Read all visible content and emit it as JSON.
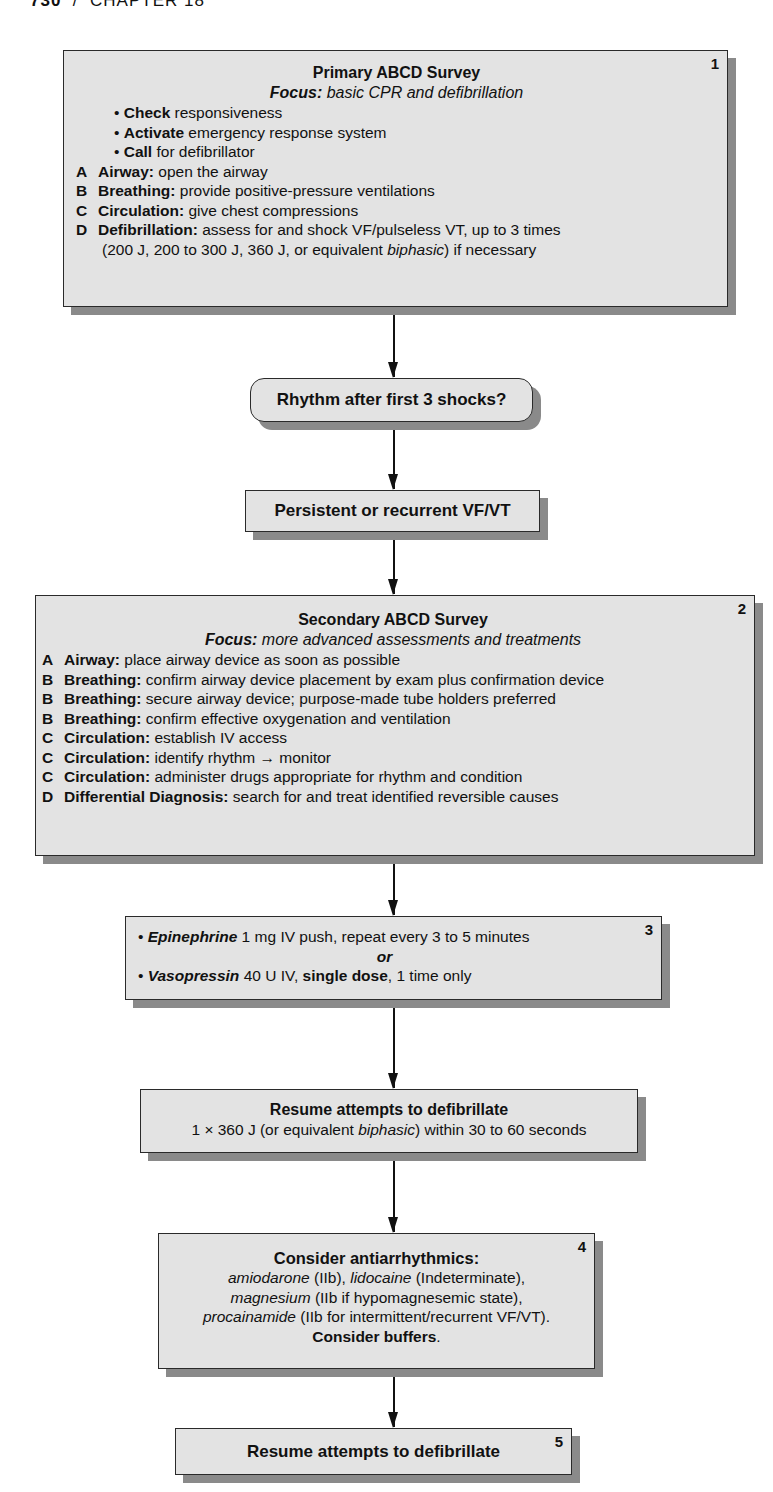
{
  "page_header": {
    "page_number": "730",
    "separator": "/",
    "chapter": "CHAPTER 18"
  },
  "box1": {
    "badge": "1",
    "title": "Primary ABCD Survey",
    "focus_label": "Focus:",
    "focus_text": " basic CPR and defibrillation",
    "bullets": [
      {
        "bold": "Check",
        "text": " responsiveness"
      },
      {
        "bold": "Activate",
        "text": " emergency response system"
      },
      {
        "bold": "Call",
        "text": " for defibrillator"
      }
    ],
    "steps": [
      {
        "letter": "A",
        "bold": "Airway:",
        "text": " open the airway"
      },
      {
        "letter": "B",
        "bold": "Breathing:",
        "text": " provide positive-pressure ventilations"
      },
      {
        "letter": "C",
        "bold": "Circulation:",
        "text": " give chest compressions"
      },
      {
        "letter": "D",
        "bold": "Defibrillation:",
        "text": " assess for and shock VF/pulseless VT, up to 3 times"
      }
    ],
    "continuation_pre": "(200 J, 200 to 300 J, 360 J, or equivalent ",
    "continuation_italic": "biphasic",
    "continuation_post": ") if necessary"
  },
  "decision": {
    "label": "Rhythm after first 3 shocks?"
  },
  "persistent": {
    "label": "Persistent or recurrent VF/VT"
  },
  "box2": {
    "badge": "2",
    "title": "Secondary ABCD Survey",
    "focus_label": "Focus:",
    "focus_text": " more advanced assessments and treatments",
    "steps": [
      {
        "letter": "A",
        "bold": "Airway:",
        "text": " place airway device as soon as possible"
      },
      {
        "letter": "B",
        "bold": "Breathing:",
        "text": " confirm airway device placement by exam plus confirmation device"
      },
      {
        "letter": "B",
        "bold": "Breathing:",
        "text": " secure airway device; purpose-made tube holders preferred"
      },
      {
        "letter": "B",
        "bold": "Breathing:",
        "text": " confirm effective oxygenation and ventilation"
      },
      {
        "letter": "C",
        "bold": "Circulation:",
        "text": " establish IV access"
      },
      {
        "letter": "C",
        "bold": "Circulation:",
        "text": " identify rhythm → monitor"
      },
      {
        "letter": "C",
        "bold": "Circulation:",
        "text": " administer drugs appropriate for rhythm and condition"
      },
      {
        "letter": "D",
        "bold": "Differential Diagnosis:",
        "text": " search for and treat identified reversible causes"
      }
    ]
  },
  "box3": {
    "badge": "3",
    "line1_drug": "Epinephrine",
    "line1_text": " 1 mg IV push, repeat every 3 to 5 minutes",
    "or": "or",
    "line2_drug": "Vasopressin",
    "line2_text_a": " 40 U IV, ",
    "line2_bold": "single dose",
    "line2_text_b": ", 1 time only"
  },
  "resume1": {
    "title": "Resume attempts to defibrillate",
    "sub_pre": "1 × 360 J (or equivalent ",
    "sub_italic": "biphasic",
    "sub_post": ") within 30 to 60 seconds"
  },
  "box4": {
    "badge": "4",
    "title": "Consider antiarrhythmics:",
    "l1_drug1": "amiodarone",
    "l1_t1": " (IIb), ",
    "l1_drug2": "lidocaine",
    "l1_t2": " (Indeterminate),",
    "l2_drug": "magnesium",
    "l2_t": " (IIb if hypomagnesemic state),",
    "l3_drug": "procainamide",
    "l3_t": " (IIb for intermittent/recurrent VF/VT).",
    "l4_bold": "Consider buffers",
    "l4_t": "."
  },
  "box5": {
    "badge": "5",
    "label": "Resume attempts to defibrillate"
  }
}
